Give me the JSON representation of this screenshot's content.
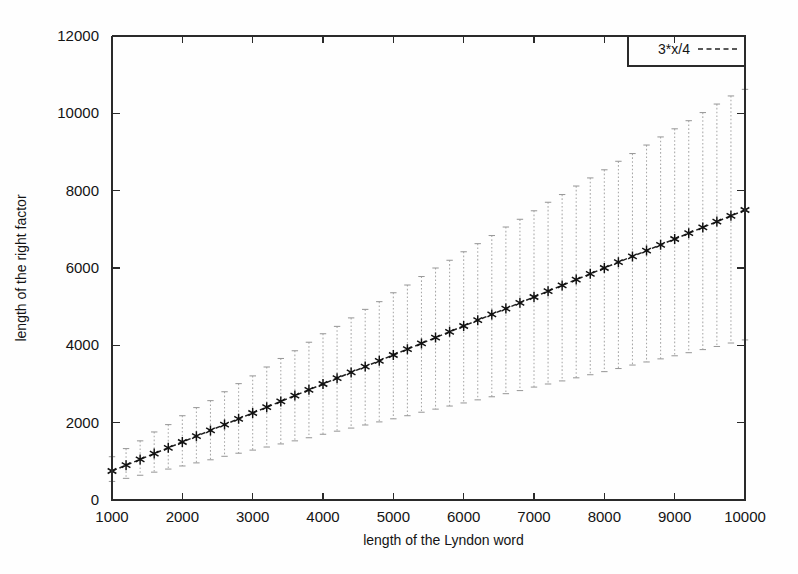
{
  "figure": {
    "background": "#fefefe",
    "ink_color": "#1a1a1a",
    "errorbar_color": "#a8a8a8"
  },
  "chart_data": {
    "type": "line",
    "title": "",
    "subtitle": "",
    "xlabel": "length of the Lyndon word",
    "ylabel": "length of the right factor",
    "xlim": [
      1000,
      10000
    ],
    "ylim": [
      0,
      12000
    ],
    "grid": false,
    "legend_position": "top-right",
    "xticks": [
      1000,
      2000,
      3000,
      4000,
      5000,
      6000,
      7000,
      8000,
      9000,
      10000
    ],
    "xticklabels": [
      "1000",
      "2000",
      "3000",
      "4000",
      "5000",
      "6000",
      "7000",
      "8000",
      "9000",
      "10000"
    ],
    "yticks": [
      0,
      2000,
      4000,
      6000,
      8000,
      10000,
      12000
    ],
    "yticklabels": [
      "0",
      "2000",
      "4000",
      "6000",
      "8000",
      "10000",
      "12000"
    ],
    "legend": [
      {
        "name": "3*x/4",
        "style": "dashed-line"
      }
    ],
    "series": [
      {
        "name": "3*x/4",
        "marker": "star",
        "linestyle": "dashed",
        "x": [
          1000,
          1200,
          1400,
          1600,
          1800,
          2000,
          2200,
          2400,
          2600,
          2800,
          3000,
          3200,
          3400,
          3600,
          3800,
          4000,
          4200,
          4400,
          4600,
          4800,
          5000,
          5200,
          5400,
          5600,
          5800,
          6000,
          6200,
          6400,
          6600,
          6800,
          7000,
          7200,
          7400,
          7600,
          7800,
          8000,
          8200,
          8400,
          8600,
          8800,
          9000,
          9200,
          9400,
          9600,
          9800,
          10000
        ],
        "values": [
          750,
          900,
          1050,
          1200,
          1350,
          1500,
          1650,
          1800,
          1950,
          2100,
          2250,
          2400,
          2550,
          2700,
          2850,
          3000,
          3150,
          3300,
          3450,
          3600,
          3750,
          3900,
          4050,
          4200,
          4350,
          4500,
          4650,
          4800,
          4950,
          5100,
          5250,
          5400,
          5550,
          5700,
          5850,
          6000,
          6150,
          6300,
          6450,
          6600,
          6750,
          6900,
          7050,
          7200,
          7350,
          7500
        ],
        "error_upper": [
          1120,
          1330,
          1530,
          1760,
          1950,
          2180,
          2390,
          2570,
          2800,
          3010,
          3210,
          3440,
          3660,
          3860,
          4080,
          4300,
          4490,
          4710,
          4930,
          5130,
          5360,
          5560,
          5780,
          6000,
          6200,
          6420,
          6630,
          6840,
          7060,
          7260,
          7480,
          7700,
          7900,
          8120,
          8330,
          8540,
          8760,
          8960,
          9180,
          9390,
          9600,
          9810,
          10020,
          10240,
          10450,
          10620
        ],
        "error_lower": [
          480,
          560,
          640,
          720,
          800,
          880,
          960,
          1040,
          1130,
          1210,
          1290,
          1370,
          1450,
          1530,
          1610,
          1700,
          1780,
          1860,
          1940,
          2020,
          2100,
          2180,
          2270,
          2350,
          2430,
          2510,
          2590,
          2670,
          2750,
          2830,
          2920,
          3000,
          3080,
          3160,
          3240,
          3320,
          3400,
          3490,
          3570,
          3650,
          3730,
          3810,
          3890,
          3970,
          4060,
          4140
        ]
      }
    ]
  }
}
